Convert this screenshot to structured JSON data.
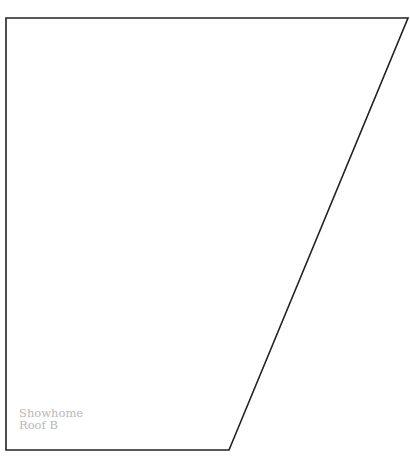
{
  "diagram": {
    "shape": "quadrilateral",
    "stroke_color": "#222222",
    "fill_color": "#ffffff",
    "points": [
      [
        6,
        18
      ],
      [
        408,
        18
      ],
      [
        229,
        450
      ],
      [
        6,
        450
      ]
    ],
    "label": {
      "line1": "Showhome",
      "line2": "Roof B",
      "color": "#b8b8b8"
    }
  }
}
